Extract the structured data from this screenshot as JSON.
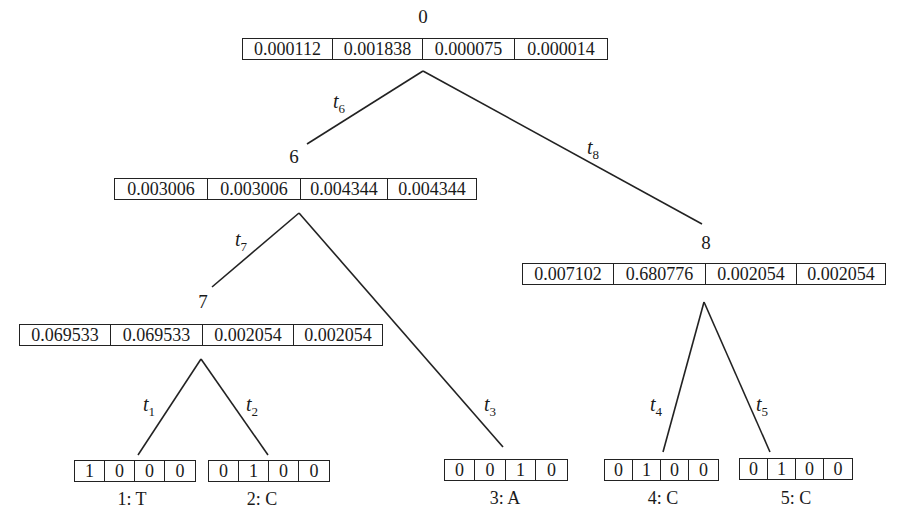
{
  "diagram": {
    "internal_nodes": [
      {
        "id": "0",
        "label": "0",
        "vector": [
          "0.000112",
          "0.001838",
          "0.000075",
          "0.000014"
        ]
      },
      {
        "id": "6",
        "label": "6",
        "vector": [
          "0.003006",
          "0.003006",
          "0.004344",
          "0.004344"
        ]
      },
      {
        "id": "7",
        "label": "7",
        "vector": [
          "0.069533",
          "0.069533",
          "0.002054",
          "0.002054"
        ]
      },
      {
        "id": "8",
        "label": "8",
        "vector": [
          "0.007102",
          "0.680776",
          "0.002054",
          "0.002054"
        ]
      }
    ],
    "leaves": [
      {
        "id": "1",
        "name": "1: T",
        "vector": [
          "1",
          "0",
          "0",
          "0"
        ]
      },
      {
        "id": "2",
        "name": "2: C",
        "vector": [
          "0",
          "1",
          "0",
          "0"
        ]
      },
      {
        "id": "3",
        "name": "3: A",
        "vector": [
          "0",
          "0",
          "1",
          "0"
        ]
      },
      {
        "id": "4",
        "name": "4: C",
        "vector": [
          "0",
          "1",
          "0",
          "0"
        ]
      },
      {
        "id": "5",
        "name": "5: C",
        "vector": [
          "0",
          "1",
          "0",
          "0"
        ]
      }
    ],
    "edges": [
      {
        "from": "0",
        "to": "6",
        "label": "t",
        "sub": "6"
      },
      {
        "from": "0",
        "to": "8",
        "label": "t",
        "sub": "8"
      },
      {
        "from": "6",
        "to": "7",
        "label": "t",
        "sub": "7"
      },
      {
        "from": "6",
        "to": "3",
        "label": "t",
        "sub": "3"
      },
      {
        "from": "7",
        "to": "1",
        "label": "t",
        "sub": "1"
      },
      {
        "from": "7",
        "to": "2",
        "label": "t",
        "sub": "2"
      },
      {
        "from": "8",
        "to": "4",
        "label": "t",
        "sub": "4"
      },
      {
        "from": "8",
        "to": "5",
        "label": "t",
        "sub": "5"
      }
    ]
  }
}
